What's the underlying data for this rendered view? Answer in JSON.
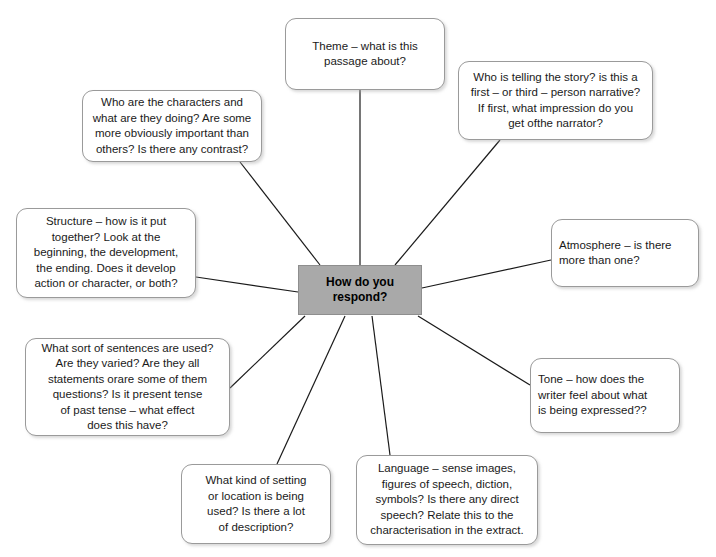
{
  "diagram": {
    "center": {
      "label": "How do you\nrespond?",
      "fill_color": "#a9a9a9",
      "border_color": "#8e8e8e",
      "x": 298,
      "y": 265,
      "width": 124,
      "height": 50
    },
    "style": {
      "node_fill": "#ffffff",
      "node_border": "#9a9a9a",
      "connector_color": "#1a1a1a",
      "text_color": "#1a1a1a",
      "background": "#ffffff"
    },
    "nodes": [
      {
        "id": "theme",
        "name": "theme-node",
        "text": "Theme – what is this\npassage about?",
        "align": "center",
        "x": 285,
        "y": 18,
        "width": 160,
        "height": 72,
        "anchor_x": 360,
        "anchor_y": 90
      },
      {
        "id": "narrator",
        "name": "narrator-node",
        "text": "Who is telling the story? is this a\nfirst – or third – person narrative?\nIf first, what impression do you\nget ofthe  narrator?",
        "align": "center",
        "x": 458,
        "y": 61,
        "width": 195,
        "height": 79,
        "anchor_x": 500,
        "anchor_y": 140
      },
      {
        "id": "characters",
        "name": "characters-node",
        "text": "Who are the characters and\nwhat are they doing? Are some\nmore obviously important than\nothers? Is there any contrast?",
        "align": "center",
        "x": 82,
        "y": 90,
        "width": 180,
        "height": 72,
        "anchor_x": 240,
        "anchor_y": 162
      },
      {
        "id": "structure",
        "name": "structure-node",
        "text": "Structure – how is it put\ntogether? Look at the\nbeginning, the development,\nthe ending. Does it develop\naction or character, or both?",
        "align": "center",
        "x": 16,
        "y": 208,
        "width": 180,
        "height": 90,
        "anchor_x": 196,
        "anchor_y": 277
      },
      {
        "id": "atmosphere",
        "name": "atmosphere-node",
        "text": "Atmosphere – is there\nmore than one?",
        "align": "left",
        "x": 551,
        "y": 219,
        "width": 148,
        "height": 68,
        "anchor_x": 551,
        "anchor_y": 260
      },
      {
        "id": "sentences",
        "name": "sentences-node",
        "text": "What sort of sentences are used?\nAre they varied? Are they all\nstatements orare some of them\nquestions? Is it present tense\nof past tense – what effect\ndoes this have?",
        "align": "center",
        "x": 25,
        "y": 338,
        "width": 205,
        "height": 98,
        "anchor_x": 230,
        "anchor_y": 388
      },
      {
        "id": "tone",
        "name": "tone-node",
        "text": "Tone – how does the\nwriter feel about what\nis being expressed??",
        "align": "left",
        "x": 530,
        "y": 358,
        "width": 150,
        "height": 75,
        "anchor_x": 530,
        "anchor_y": 385
      },
      {
        "id": "setting",
        "name": "setting-node",
        "text": "What kind of setting\nor location is being\nused? Is there a lot\nof description?",
        "align": "center",
        "x": 181,
        "y": 464,
        "width": 150,
        "height": 80,
        "anchor_x": 277,
        "anchor_y": 464
      },
      {
        "id": "language",
        "name": "language-node",
        "text": "Language – sense images,\nfigures of speech, diction,\nsymbols? Is there any direct\nspeech? Relate this to the\ncharacterisation in the extract.",
        "align": "center",
        "x": 356,
        "y": 455,
        "width": 182,
        "height": 90,
        "anchor_x": 390,
        "anchor_y": 455
      }
    ],
    "connectors": [
      {
        "id": "c-theme",
        "name": "connector-theme",
        "x1": 360,
        "y1": 90,
        "x2": 360,
        "y2": 265
      },
      {
        "id": "c-narrator",
        "name": "connector-narrator",
        "x1": 500,
        "y1": 140,
        "x2": 395,
        "y2": 265
      },
      {
        "id": "c-characters",
        "name": "connector-characters",
        "x1": 240,
        "y1": 162,
        "x2": 320,
        "y2": 265
      },
      {
        "id": "c-structure",
        "name": "connector-structure",
        "x1": 196,
        "y1": 277,
        "x2": 298,
        "y2": 292
      },
      {
        "id": "c-atmosphere",
        "name": "connector-atmosphere",
        "x1": 551,
        "y1": 260,
        "x2": 422,
        "y2": 288
      },
      {
        "id": "c-sentences",
        "name": "connector-sentences",
        "x1": 230,
        "y1": 388,
        "x2": 305,
        "y2": 316
      },
      {
        "id": "c-tone",
        "name": "connector-tone",
        "x1": 530,
        "y1": 385,
        "x2": 418,
        "y2": 316
      },
      {
        "id": "c-setting",
        "name": "connector-setting",
        "x1": 277,
        "y1": 464,
        "x2": 345,
        "y2": 316
      },
      {
        "id": "c-language",
        "name": "connector-language",
        "x1": 390,
        "y1": 455,
        "x2": 372,
        "y2": 316
      }
    ]
  }
}
